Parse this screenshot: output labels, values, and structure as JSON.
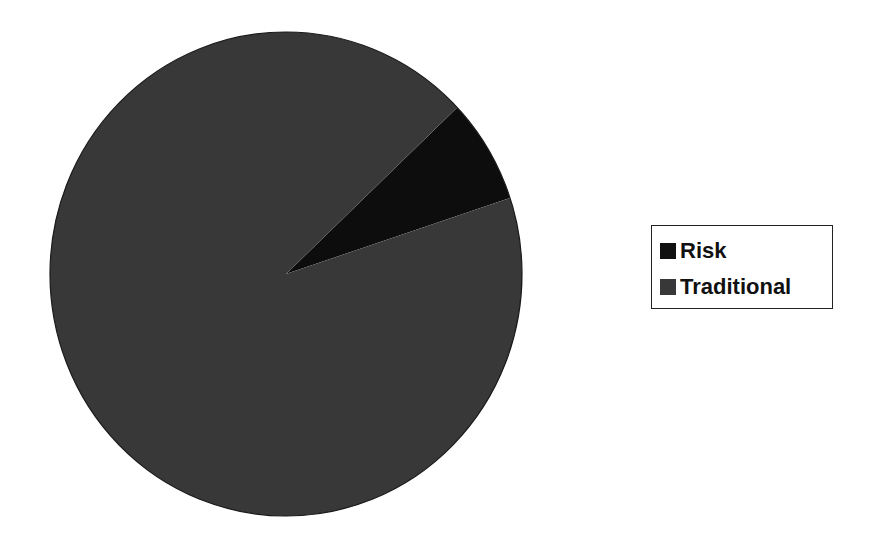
{
  "chart_data": {
    "type": "pie",
    "title": "",
    "categories": [
      "Risk",
      "Traditional"
    ],
    "values": [
      7,
      93
    ],
    "unit": "percent (estimated)",
    "colors": [
      "#111111",
      "#383838"
    ],
    "start_angle_deg_clockwise_from_top": 46.5,
    "legend": {
      "position": "right",
      "entries": [
        "Risk",
        "Traditional"
      ]
    }
  },
  "legend": {
    "items": [
      {
        "label": "Risk",
        "color": "#111111"
      },
      {
        "label": "Traditional",
        "color": "#383838"
      }
    ]
  }
}
